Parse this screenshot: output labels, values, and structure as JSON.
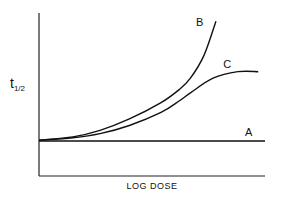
{
  "chart_data": {
    "type": "line",
    "title": "",
    "xlabel": "LOG DOSE",
    "ylabel": "t",
    "ylabel_subscript": "1/2",
    "xlim": [
      0,
      10
    ],
    "ylim": [
      0,
      10
    ],
    "grid": false,
    "ticks": false,
    "legend": "inline-labels",
    "series": [
      {
        "name": "A",
        "points": [
          [
            0,
            2.15
          ],
          [
            10,
            2.15
          ]
        ]
      },
      {
        "name": "B",
        "points": [
          [
            0,
            2.2
          ],
          [
            1.5,
            2.4
          ],
          [
            2.7,
            2.8
          ],
          [
            4.0,
            3.5
          ],
          [
            5.4,
            4.5
          ],
          [
            6.2,
            5.3
          ],
          [
            6.7,
            6.0
          ],
          [
            7.3,
            7.4
          ],
          [
            7.83,
            9.5
          ]
        ]
      },
      {
        "name": "C",
        "points": [
          [
            0,
            2.2
          ],
          [
            1.5,
            2.35
          ],
          [
            2.7,
            2.6
          ],
          [
            4.0,
            3.1
          ],
          [
            5.4,
            3.9
          ],
          [
            6.2,
            4.6
          ],
          [
            6.7,
            5.1
          ],
          [
            7.7,
            6.0
          ],
          [
            8.8,
            6.4
          ],
          [
            9.7,
            6.4
          ]
        ]
      }
    ],
    "annotations": [
      {
        "text": "A",
        "series": "A"
      },
      {
        "text": "B",
        "series": "B"
      },
      {
        "text": "C",
        "series": "C"
      }
    ]
  }
}
